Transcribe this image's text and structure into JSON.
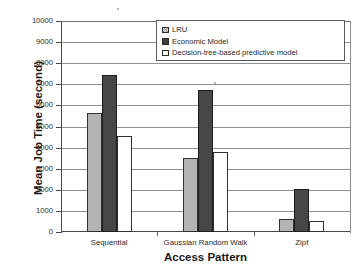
{
  "chart_data": {
    "type": "bar",
    "title": "",
    "xlabel": "Access Pattern",
    "ylabel": "Mean Job Time (second)",
    "categories": [
      "Sequential",
      "Gaussian Random Walk",
      "Zipf"
    ],
    "series": [
      {
        "name": "LRU",
        "values": [
          5640,
          3500,
          620
        ],
        "color": "#b4b4b4"
      },
      {
        "name": "Economic Model",
        "values": [
          7420,
          6750,
          2050
        ],
        "color": "#474747"
      },
      {
        "name": "Decision-tree-based predictive model",
        "values": [
          4550,
          3790,
          520
        ],
        "color": "#ffffff"
      }
    ],
    "ylim": [
      0,
      10000
    ],
    "ytick_step": 1000,
    "yticks": [
      10000,
      9000,
      8000,
      7000,
      6000,
      5000,
      4000,
      3000,
      2000,
      1000,
      0
    ],
    "ytick_labels": [
      "10000",
      "9000",
      "8000",
      "7000",
      "6000",
      "5000",
      "4000",
      "3000",
      "2000",
      "1000",
      "0"
    ],
    "grid": true,
    "grid_axis": "y",
    "legend_position": "top-right",
    "bar_border_color": "#303030"
  },
  "axes": {
    "y_title": "Mean Job Time (second)",
    "x_title": "Access Pattern"
  },
  "legend": {
    "entries": [
      {
        "label": "LRU",
        "swatch": "light-gray-hatched-swatch"
      },
      {
        "label": "Economic Model",
        "swatch": "dark-filled-swatch"
      },
      {
        "label": "Decision-tree-based predictive model",
        "swatch": "white-empty-swatch"
      }
    ]
  }
}
